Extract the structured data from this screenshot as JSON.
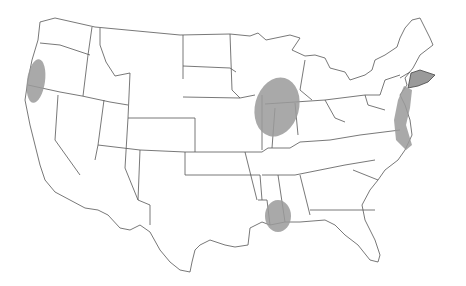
{
  "map": {
    "title": "",
    "region": "United States (contiguous)",
    "highlight_color": "#9a9a9a",
    "border_color": "#555555",
    "highlighted_areas": [
      {
        "id": "northern-california-oregon-coast",
        "label": "Northern California / Southern Oregon coast"
      },
      {
        "id": "upper-mississippi-river",
        "label": "Iowa / Illinois border along Mississippi River"
      },
      {
        "id": "northeast-corridor",
        "label": "Northeast (New England to Virginia coast)"
      },
      {
        "id": "louisiana",
        "label": "Western Louisiana"
      }
    ]
  }
}
